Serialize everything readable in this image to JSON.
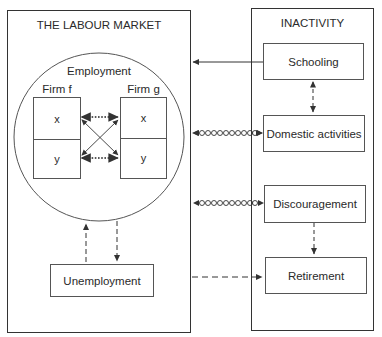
{
  "diagram": {
    "labour_market": {
      "title": "THE LABOUR MARKET",
      "employment": {
        "label": "Employment",
        "firms": [
          {
            "label": "Firm f",
            "cells": [
              "x",
              "y"
            ]
          },
          {
            "label": "Firm g",
            "cells": [
              "x",
              "y"
            ]
          }
        ]
      },
      "unemployment": "Unemployment"
    },
    "inactivity": {
      "title": "INACTIVITY",
      "states": [
        {
          "label": "Schooling"
        },
        {
          "label": "Domestic activities"
        },
        {
          "label": "Discouragement"
        },
        {
          "label": "Retirement"
        }
      ]
    },
    "flows": [
      {
        "from": "Schooling",
        "to": "THE LABOUR MARKET",
        "style": "solid",
        "direction": "one-way"
      },
      {
        "from": "Schooling",
        "to": "Domestic activities",
        "style": "dashed",
        "direction": "two-way"
      },
      {
        "from": "Domestic activities",
        "to": "THE LABOUR MARKET",
        "style": "circle-chain",
        "direction": "two-way"
      },
      {
        "from": "Discouragement",
        "to": "THE LABOUR MARKET",
        "style": "circle-chain",
        "direction": "two-way"
      },
      {
        "from": "Discouragement",
        "to": "Retirement",
        "style": "dashed",
        "direction": "one-way"
      },
      {
        "from": "THE LABOUR MARKET",
        "to": "Retirement",
        "style": "dashed",
        "direction": "one-way"
      },
      {
        "from": "Unemployment",
        "to": "Employment",
        "style": "dashed",
        "direction": "one-way"
      },
      {
        "from": "Employment",
        "to": "Unemployment",
        "style": "dashed",
        "direction": "one-way"
      },
      {
        "from": "Firm f x",
        "to": "Firm g x",
        "style": "dotted",
        "direction": "two-way"
      },
      {
        "from": "Firm f y",
        "to": "Firm g y",
        "style": "dotted",
        "direction": "two-way"
      },
      {
        "from": "Firm f x",
        "to": "Firm g y",
        "style": "solid",
        "direction": "two-way"
      },
      {
        "from": "Firm f y",
        "to": "Firm g x",
        "style": "solid",
        "direction": "two-way"
      }
    ]
  }
}
